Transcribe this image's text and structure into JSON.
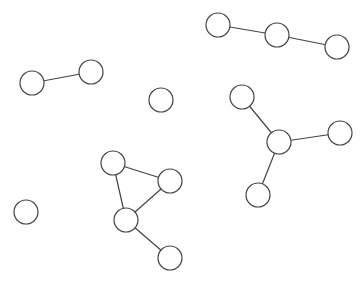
{
  "diagram": {
    "type": "undirected-graph",
    "node_radius": 12,
    "stroke_color": "#444444",
    "fill_color": "#ffffff",
    "background": "#ffffff",
    "nodes": [
      {
        "id": "A",
        "x": 32,
        "y": 83
      },
      {
        "id": "B",
        "x": 91,
        "y": 72
      },
      {
        "id": "C",
        "x": 161,
        "y": 100
      },
      {
        "id": "D",
        "x": 218,
        "y": 25
      },
      {
        "id": "E",
        "x": 277,
        "y": 35
      },
      {
        "id": "F",
        "x": 337,
        "y": 47
      },
      {
        "id": "G",
        "x": 242,
        "y": 97
      },
      {
        "id": "H",
        "x": 279,
        "y": 142
      },
      {
        "id": "I",
        "x": 340,
        "y": 133
      },
      {
        "id": "J",
        "x": 258,
        "y": 195
      },
      {
        "id": "K",
        "x": 26,
        "y": 212
      },
      {
        "id": "L",
        "x": 113,
        "y": 163
      },
      {
        "id": "M",
        "x": 170,
        "y": 181
      },
      {
        "id": "N",
        "x": 126,
        "y": 220
      },
      {
        "id": "O",
        "x": 170,
        "y": 258
      }
    ],
    "edges": [
      [
        "A",
        "B"
      ],
      [
        "D",
        "E"
      ],
      [
        "E",
        "F"
      ],
      [
        "G",
        "H"
      ],
      [
        "H",
        "I"
      ],
      [
        "H",
        "J"
      ],
      [
        "L",
        "M"
      ],
      [
        "L",
        "N"
      ],
      [
        "M",
        "N"
      ],
      [
        "N",
        "O"
      ]
    ]
  }
}
